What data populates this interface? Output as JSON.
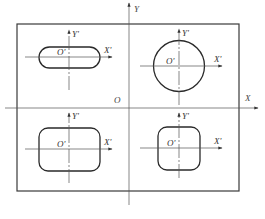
{
  "diagram": {
    "main_axes": {
      "x_label": "X",
      "y_label": "Y",
      "origin_label": "O"
    },
    "local_systems": [
      {
        "id": "slot",
        "shape": "slot",
        "origin_label": "O'",
        "x_label": "X'",
        "y_label": "Y'"
      },
      {
        "id": "circle",
        "shape": "circle",
        "origin_label": "O'",
        "x_label": "X'",
        "y_label": "Y'"
      },
      {
        "id": "rounded-rect",
        "shape": "rounded-rectangle",
        "origin_label": "O'",
        "x_label": "X'",
        "y_label": "Y'"
      },
      {
        "id": "rounded-square",
        "shape": "rounded-square",
        "origin_label": "O'",
        "x_label": "X'",
        "y_label": "Y'"
      }
    ],
    "colors": {
      "line": "#2a2a2a",
      "axis": "#555555",
      "background": "#ffffff"
    }
  }
}
